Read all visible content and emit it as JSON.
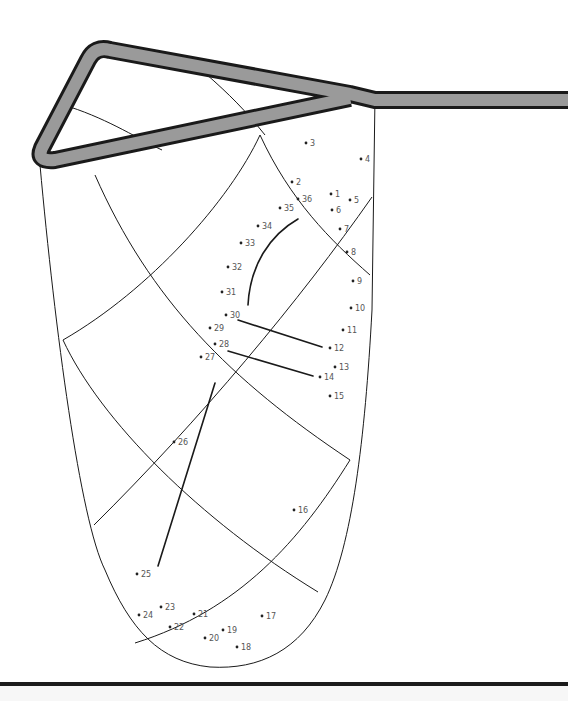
{
  "puzzle": {
    "type": "connect-the-dots",
    "subject": "lacrosse stick head with net",
    "colors": {
      "outline": "#1a1a1a",
      "frame_fill": "#9a9a9a",
      "dot": "#222222",
      "label": "#555555",
      "background": "#ffffff",
      "footer_bar": "#1c1c1c"
    },
    "dots": [
      {
        "n": "1",
        "x": 331,
        "y": 194
      },
      {
        "n": "2",
        "x": 292,
        "y": 182
      },
      {
        "n": "3",
        "x": 306,
        "y": 143
      },
      {
        "n": "4",
        "x": 361,
        "y": 159
      },
      {
        "n": "5",
        "x": 350,
        "y": 200
      },
      {
        "n": "6",
        "x": 332,
        "y": 210
      },
      {
        "n": "7",
        "x": 340,
        "y": 229
      },
      {
        "n": "8",
        "x": 347,
        "y": 252
      },
      {
        "n": "9",
        "x": 353,
        "y": 281
      },
      {
        "n": "10",
        "x": 351,
        "y": 308
      },
      {
        "n": "11",
        "x": 343,
        "y": 330
      },
      {
        "n": "12",
        "x": 330,
        "y": 348
      },
      {
        "n": "13",
        "x": 335,
        "y": 367
      },
      {
        "n": "14",
        "x": 320,
        "y": 377
      },
      {
        "n": "15",
        "x": 330,
        "y": 396
      },
      {
        "n": "16",
        "x": 294,
        "y": 510
      },
      {
        "n": "17",
        "x": 262,
        "y": 616
      },
      {
        "n": "18",
        "x": 237,
        "y": 647
      },
      {
        "n": "19",
        "x": 223,
        "y": 630
      },
      {
        "n": "20",
        "x": 205,
        "y": 638
      },
      {
        "n": "21",
        "x": 194,
        "y": 614
      },
      {
        "n": "22",
        "x": 170,
        "y": 627
      },
      {
        "n": "23",
        "x": 161,
        "y": 607
      },
      {
        "n": "24",
        "x": 139,
        "y": 615
      },
      {
        "n": "25",
        "x": 137,
        "y": 574
      },
      {
        "n": "26",
        "x": 174,
        "y": 442
      },
      {
        "n": "27",
        "x": 201,
        "y": 357
      },
      {
        "n": "28",
        "x": 215,
        "y": 344
      },
      {
        "n": "29",
        "x": 210,
        "y": 328
      },
      {
        "n": "30",
        "x": 226,
        "y": 315
      },
      {
        "n": "31",
        "x": 222,
        "y": 292
      },
      {
        "n": "32",
        "x": 228,
        "y": 267
      },
      {
        "n": "33",
        "x": 241,
        "y": 243
      },
      {
        "n": "34",
        "x": 258,
        "y": 226
      },
      {
        "n": "35",
        "x": 280,
        "y": 208
      },
      {
        "n": "36",
        "x": 298,
        "y": 199
      }
    ]
  }
}
